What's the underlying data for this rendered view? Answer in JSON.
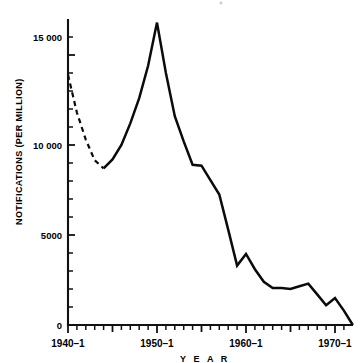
{
  "chart_data": {
    "type": "line",
    "title": "",
    "xlabel": "Y E A R",
    "ylabel": "NOTIFICATIONS (PER MILLION)",
    "xlim": [
      1940,
      1972
    ],
    "ylim": [
      0,
      17000
    ],
    "grid": false,
    "legend": "none",
    "y_ticks_major": [
      0,
      5000,
      10000,
      15000
    ],
    "y_tick_labels": [
      "0",
      "5000",
      "10 000",
      "15 000"
    ],
    "y_tick_interval_minor": 1000,
    "x_ticks_major": [
      1940,
      1950,
      1960,
      1970
    ],
    "x_tick_labels": [
      "1940–1",
      "1950–1",
      "1960–1",
      "1970–1"
    ],
    "x_tick_interval_minor": 1,
    "series": [
      {
        "name": "Notifications (estimated)",
        "style": "dashed",
        "x": [
          1940,
          1941,
          1942,
          1943,
          1944
        ],
        "values": [
          13900,
          11800,
          10300,
          9150,
          8700
        ]
      },
      {
        "name": "Notifications (recorded)",
        "style": "solid",
        "x": [
          1944,
          1945,
          1946,
          1947,
          1948,
          1949,
          1950,
          1951,
          1952,
          1953,
          1954,
          1955,
          1956,
          1957,
          1958,
          1959,
          1960,
          1961,
          1962,
          1963,
          1964,
          1965,
          1966,
          1967,
          1968,
          1969,
          1970,
          1971,
          1972
        ],
        "values": [
          8700,
          9200,
          10000,
          11200,
          12600,
          14400,
          16800,
          14000,
          11600,
          10200,
          8900,
          8850,
          8050,
          7250,
          5300,
          3300,
          3950,
          3100,
          2400,
          2050,
          2050,
          2000,
          2150,
          2300,
          1700,
          1100,
          1500,
          800,
          0
        ]
      }
    ]
  }
}
